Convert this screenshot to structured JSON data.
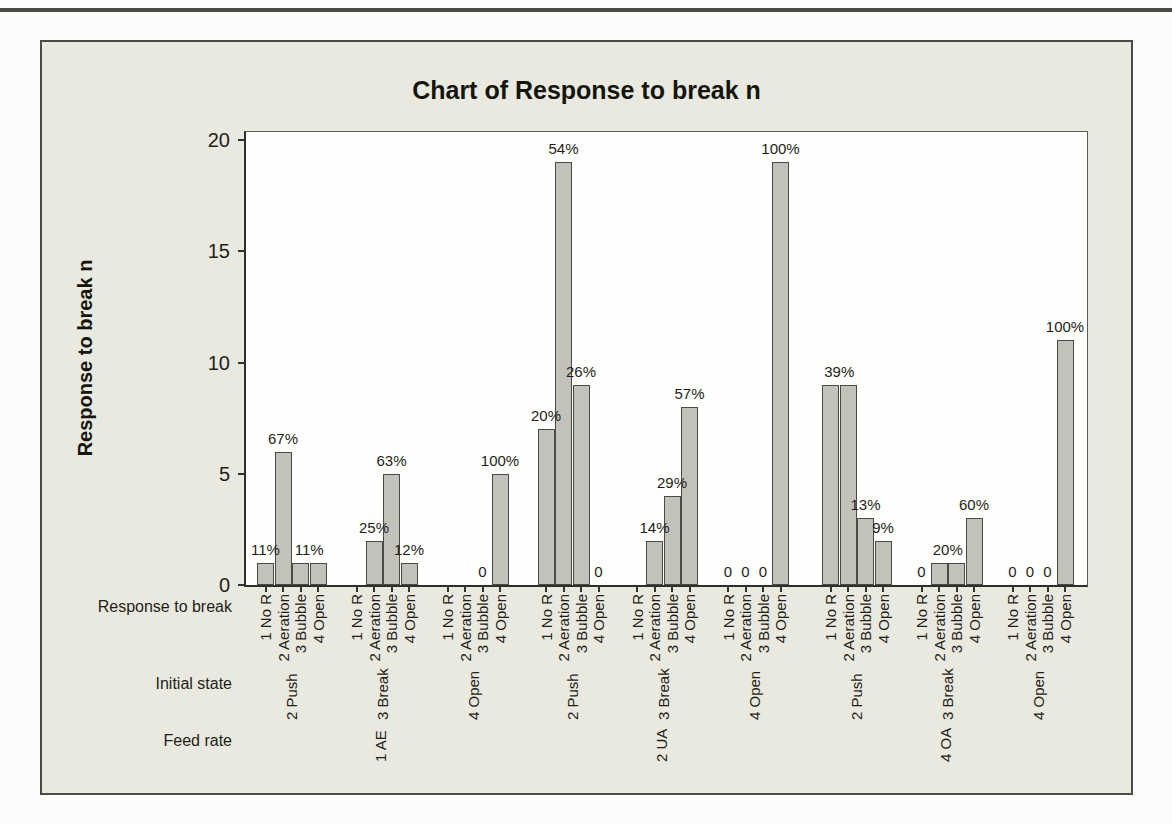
{
  "chart_data": {
    "type": "bar",
    "title": "Chart of Response to break n",
    "ylabel": "Response to break n",
    "ylim": [
      0,
      20
    ],
    "yticks": [
      0,
      5,
      10,
      15,
      20
    ],
    "grid": false,
    "legend": null,
    "background_color": "#e9e9df",
    "plot_background": "#fefefc",
    "bar_color": "#c3c2ba",
    "bar_border_color": "#4b4a44",
    "axis_rows": {
      "inner_label": "Response to break",
      "middle_label": "Initial state",
      "outer_label": "Feed rate"
    },
    "inner_categories": [
      "1 No R",
      "2 Aeration",
      "3 Bubble",
      "4 Open"
    ],
    "groups": [
      {
        "initial_state": "2 Push",
        "feed_rate": null,
        "values": [
          1,
          6,
          1,
          1
        ],
        "bar_labels": [
          {
            "text": "11%",
            "slot": 0
          },
          {
            "text": "67%",
            "slot": 1
          },
          {
            "text": "11%",
            "slot": 2.5
          }
        ]
      },
      {
        "initial_state": "3 Break",
        "feed_rate": "1 AE",
        "values": [
          0,
          2,
          5,
          1
        ],
        "bar_labels": [
          {
            "text": "25%",
            "slot": 1
          },
          {
            "text": "63%",
            "slot": 2
          },
          {
            "text": "12%",
            "slot": 3
          }
        ]
      },
      {
        "initial_state": "4 Open",
        "feed_rate": null,
        "values": [
          0,
          0,
          0,
          5
        ],
        "bar_labels": [
          {
            "text": "0",
            "slot": 2
          },
          {
            "text": "100%",
            "slot": 3
          }
        ]
      },
      {
        "initial_state": "2 Push",
        "feed_rate": null,
        "values": [
          7,
          19,
          9,
          0
        ],
        "bar_labels": [
          {
            "text": "20%",
            "slot": 0
          },
          {
            "text": "54%",
            "slot": 1
          },
          {
            "text": "26%",
            "slot": 2
          },
          {
            "text": "0",
            "slot": 3
          }
        ]
      },
      {
        "initial_state": "3 Break",
        "feed_rate": "2 UA",
        "values": [
          0,
          2,
          4,
          8
        ],
        "bar_labels": [
          {
            "text": "14%",
            "slot": 1
          },
          {
            "text": "29%",
            "slot": 2
          },
          {
            "text": "57%",
            "slot": 3
          }
        ]
      },
      {
        "initial_state": "4 Open",
        "feed_rate": null,
        "values": [
          0,
          0,
          0,
          19
        ],
        "bar_labels": [
          {
            "text": "0",
            "slot": 0
          },
          {
            "text": "0",
            "slot": 1
          },
          {
            "text": "0",
            "slot": 2
          },
          {
            "text": "100%",
            "slot": 3
          }
        ]
      },
      {
        "initial_state": "2 Push",
        "feed_rate": null,
        "values": [
          9,
          9,
          3,
          2
        ],
        "bar_labels": [
          {
            "text": "39%",
            "slot": 0.5
          },
          {
            "text": "13%",
            "slot": 2
          },
          {
            "text": "9%",
            "slot": 3
          }
        ]
      },
      {
        "initial_state": "3 Break",
        "feed_rate": "4 OA",
        "values": [
          0,
          1,
          1,
          3
        ],
        "bar_labels": [
          {
            "text": "0",
            "slot": 0
          },
          {
            "text": "20%",
            "slot": 1.5
          },
          {
            "text": "60%",
            "slot": 3
          }
        ]
      },
      {
        "initial_state": "4 Open",
        "feed_rate": null,
        "values": [
          0,
          0,
          0,
          11
        ],
        "bar_labels": [
          {
            "text": "0",
            "slot": 0
          },
          {
            "text": "0",
            "slot": 1
          },
          {
            "text": "0",
            "slot": 2
          },
          {
            "text": "100%",
            "slot": 3
          }
        ]
      }
    ]
  }
}
